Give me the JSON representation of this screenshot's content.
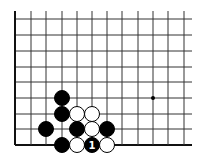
{
  "diagram": {
    "type": "go-board-fragment",
    "region": "lower-left corner",
    "edges": [
      "left",
      "bottom"
    ],
    "grid": {
      "columns_x": [
        15,
        31,
        46,
        62,
        77,
        92,
        107,
        122,
        138,
        153,
        168,
        184
      ],
      "rows_y": [
        19,
        35,
        51,
        67,
        82,
        98,
        114,
        129,
        145
      ],
      "line_extend_right": 192,
      "line_extend_top": 11,
      "line_color": "#333333",
      "edge_color": "#111111"
    },
    "star_points": [
      {
        "col": 9,
        "row": 5
      }
    ],
    "stones": [
      {
        "color": "black",
        "col": 3,
        "row": 5
      },
      {
        "color": "black",
        "col": 3,
        "row": 6
      },
      {
        "color": "white",
        "col": 4,
        "row": 6
      },
      {
        "color": "white",
        "col": 5,
        "row": 6
      },
      {
        "color": "black",
        "col": 2,
        "row": 7
      },
      {
        "color": "black",
        "col": 4,
        "row": 7
      },
      {
        "color": "white",
        "col": 5,
        "row": 7
      },
      {
        "color": "black",
        "col": 6,
        "row": 7
      },
      {
        "color": "black",
        "col": 3,
        "row": 8
      },
      {
        "color": "white",
        "col": 4,
        "row": 8
      },
      {
        "color": "black",
        "col": 5,
        "row": 8,
        "label": "1"
      },
      {
        "color": "white",
        "col": 6,
        "row": 8
      }
    ],
    "stone_radius": 7.5
  }
}
